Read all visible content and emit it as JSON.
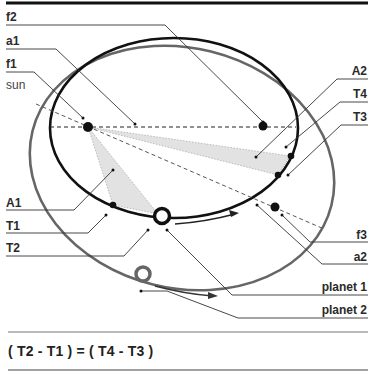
{
  "diagram": {
    "labels_left": [
      {
        "id": "f2",
        "text": "f2"
      },
      {
        "id": "a1",
        "text": "a1"
      },
      {
        "id": "f1",
        "text": "f1"
      },
      {
        "id": "sun",
        "text": "sun"
      },
      {
        "id": "A1",
        "text": "A1"
      },
      {
        "id": "T1",
        "text": "T1"
      },
      {
        "id": "T2",
        "text": "T2"
      }
    ],
    "labels_right": [
      {
        "id": "A2",
        "text": "A2"
      },
      {
        "id": "T4",
        "text": "T4"
      },
      {
        "id": "T3",
        "text": "T3"
      },
      {
        "id": "f3",
        "text": "f3"
      },
      {
        "id": "a2",
        "text": "a2"
      },
      {
        "id": "planet1",
        "text": "planet 1"
      },
      {
        "id": "planet2",
        "text": "planet 2"
      }
    ],
    "equation": "( T2 - T1 ) = ( T4 - T3 )",
    "colors": {
      "orbit_planet1": "#111111",
      "orbit_planet2": "#666666",
      "swept_area": "#e4e4e4",
      "leader_lines": "#333333",
      "text": "#2a2a2a"
    }
  }
}
